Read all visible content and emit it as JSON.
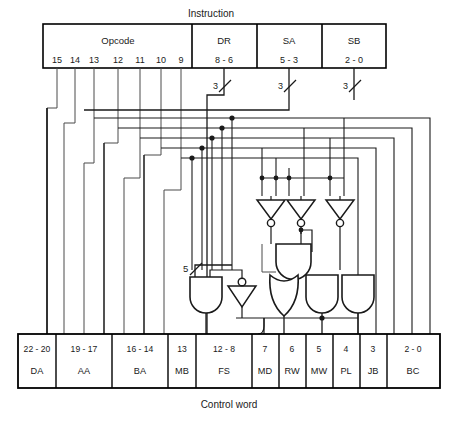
{
  "diagram": {
    "title_top": "Instruction",
    "title_bottom": "Control word",
    "colors": {
      "stroke": "#1a1a1a",
      "thin": "#4a4a4a",
      "box": "#000000",
      "background": "#ffffff"
    }
  },
  "instruction_register": {
    "fields": [
      {
        "name": "Opcode",
        "bits": "",
        "bit_labels": [
          "15",
          "14",
          "13",
          "12",
          "11",
          "10",
          "9"
        ]
      },
      {
        "name": "DR",
        "bits": "8 - 6",
        "bit_labels": []
      },
      {
        "name": "SA",
        "bits": "5 - 3",
        "bit_labels": []
      },
      {
        "name": "SB",
        "bits": "2 - 0",
        "bit_labels": []
      }
    ]
  },
  "bus_widths": {
    "dr": "3",
    "sa": "3",
    "sb": "3",
    "fs": "5"
  },
  "control_word": {
    "fields": [
      {
        "bits": "22 - 20",
        "name": "DA"
      },
      {
        "bits": "19 - 17",
        "name": "AA"
      },
      {
        "bits": "16 - 14",
        "name": "BA"
      },
      {
        "bits": "13",
        "name": "MB"
      },
      {
        "bits": "12 - 8",
        "name": "FS"
      },
      {
        "bits": "7",
        "name": "MD"
      },
      {
        "bits": "6",
        "name": "RW"
      },
      {
        "bits": "5",
        "name": "MW"
      },
      {
        "bits": "4",
        "name": "PL"
      },
      {
        "bits": "3",
        "name": "JB"
      },
      {
        "bits": "2 - 0",
        "name": "BC"
      }
    ]
  },
  "logic": {
    "gates": [
      {
        "id": "and-left",
        "type": "AND",
        "label": ""
      },
      {
        "id": "inverter-left",
        "type": "NOT",
        "label": ""
      },
      {
        "id": "inverter-1",
        "type": "NOT",
        "label": ""
      },
      {
        "id": "inverter-2",
        "type": "NOT",
        "label": ""
      },
      {
        "id": "inverter-3",
        "type": "NOT",
        "label": ""
      },
      {
        "id": "and-upper",
        "type": "AND",
        "label": ""
      },
      {
        "id": "or-lower",
        "type": "OR",
        "label": ""
      },
      {
        "id": "and-lower-1",
        "type": "AND",
        "label": ""
      },
      {
        "id": "and-lower-2",
        "type": "AND",
        "label": ""
      }
    ]
  }
}
